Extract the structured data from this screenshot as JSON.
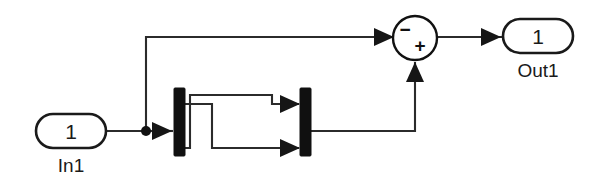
{
  "diagram": {
    "kind": "block-diagram",
    "title": "",
    "background_color": "#ffffff",
    "line_color": "#2b2b2b",
    "block_fill": "#ffffff",
    "block_stroke": "#1a1a1a",
    "bar_color": "#101010",
    "width": 591,
    "height": 186
  },
  "blocks": {
    "inport": {
      "number": "1",
      "label": "In1",
      "shape": "rounded-rect",
      "x": 36,
      "y": 114,
      "w": 70,
      "h": 34
    },
    "demux": {
      "label": "",
      "shape": "vertical-bar",
      "x": 174,
      "y": 88,
      "w": 11,
      "h": 68
    },
    "mux": {
      "label": "",
      "shape": "vertical-bar",
      "x": 300,
      "y": 88,
      "w": 11,
      "h": 68
    },
    "sum": {
      "shape": "circle",
      "cx": 415,
      "cy": 38,
      "r": 22,
      "sign_minus": "−",
      "sign_plus": "+"
    },
    "outport": {
      "number": "1",
      "label": "Out1",
      "shape": "rounded-rect",
      "x": 503,
      "y": 19,
      "w": 70,
      "h": 34
    }
  },
  "connections": [
    {
      "name": "inport-to-branch",
      "from": "inport",
      "to": "branch-point"
    },
    {
      "name": "branch-to-sum-minus",
      "from": "branch-point",
      "to": "sum.minus"
    },
    {
      "name": "branch-to-demux",
      "from": "branch-point",
      "to": "demux"
    },
    {
      "name": "demux-out1-to-mux-in2",
      "from": "demux.out1",
      "to": "mux.in2"
    },
    {
      "name": "demux-out2-to-mux-in1",
      "from": "demux.out2",
      "to": "mux.in1"
    },
    {
      "name": "mux-to-sum-plus",
      "from": "mux",
      "to": "sum.plus"
    },
    {
      "name": "sum-to-outport",
      "from": "sum",
      "to": "outport"
    }
  ],
  "branch_point": {
    "x": 146,
    "y": 131,
    "r": 5
  }
}
